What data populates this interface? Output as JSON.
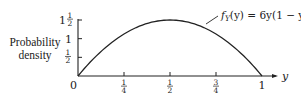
{
  "chart_data": {
    "type": "line",
    "title": "",
    "xlabel": "y",
    "ylabel": "Probability density",
    "annotation": "f_Y(y) = 6y(1 − y)",
    "annotation_display": {
      "f": "f",
      "sub": "Y",
      "rest": "(y) = 6y(1 − y)"
    },
    "x_ticks": [
      {
        "value": 0,
        "label": "0"
      },
      {
        "value": 0.25,
        "num": "1",
        "den": "4"
      },
      {
        "value": 0.5,
        "num": "1",
        "den": "2"
      },
      {
        "value": 0.75,
        "num": "3",
        "den": "4"
      },
      {
        "value": 1,
        "label": "1"
      }
    ],
    "y_ticks": [
      {
        "value": 0.5,
        "num": "1",
        "den": "2"
      },
      {
        "value": 1,
        "label": "1"
      },
      {
        "value": 1.5,
        "whole": "1",
        "num": "1",
        "den": "2"
      }
    ],
    "xlim": [
      0,
      1
    ],
    "ylim": [
      0,
      1.5
    ],
    "grid": false,
    "legend": "none",
    "series": [
      {
        "name": "f_Y(y) = 6y(1 − y)",
        "x": [
          0,
          0.1,
          0.2,
          0.25,
          0.3,
          0.4,
          0.5,
          0.6,
          0.7,
          0.75,
          0.8,
          0.9,
          1
        ],
        "values": [
          0,
          0.54,
          0.96,
          1.125,
          1.26,
          1.44,
          1.5,
          1.44,
          1.26,
          1.125,
          0.96,
          0.54,
          0
        ]
      }
    ]
  },
  "labels": {
    "ylabel_line1": "Probability",
    "ylabel_line2": "density",
    "origin": "0",
    "x_axis_var": "y"
  },
  "colors": {
    "ink": "#222222",
    "background": "#ffffff"
  }
}
